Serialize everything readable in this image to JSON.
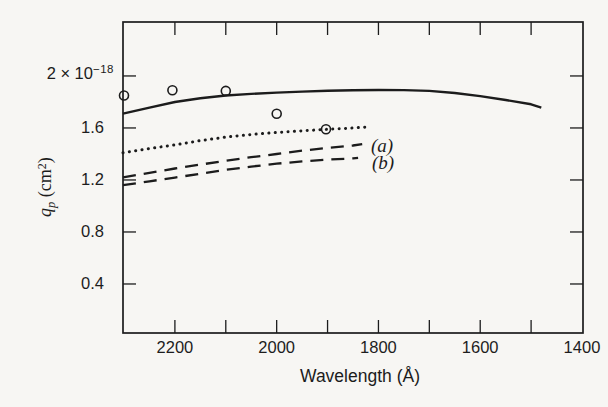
{
  "colors": {
    "ink": "#1c1c1c",
    "background": "#f7f6f3"
  },
  "chart_data": {
    "type": "line",
    "title": "",
    "xlabel": "Wavelength (Å)",
    "ylabel": "qₚ (cm²)",
    "ylabel_parts": {
      "symbol": "q",
      "subscript": "p",
      "unit_open": " (cm",
      "exponent": "2",
      "unit_close": ")"
    },
    "y_top_label": {
      "base": "2 × 10",
      "exponent": "−18"
    },
    "x_axis_reversed": true,
    "grid": false,
    "x_range": [
      2302,
      1398
    ],
    "y_range": [
      0.023,
      2.415
    ],
    "x_ticks": [
      2200,
      2100,
      2000,
      1900,
      1800,
      1700,
      1600,
      1500
    ],
    "x_tick_labels": [
      {
        "value": 2200,
        "label": "2200"
      },
      {
        "value": 2000,
        "label": "2000"
      },
      {
        "value": 1800,
        "label": "1800"
      },
      {
        "value": 1600,
        "label": "1600"
      },
      {
        "value": 1400,
        "label": "1400"
      }
    ],
    "y_ticks": [
      2.0,
      1.6,
      1.2,
      0.8,
      0.4
    ],
    "y_tick_labels": [
      {
        "value": 1.6,
        "label": "1.6"
      },
      {
        "value": 1.2,
        "label": "1.2"
      },
      {
        "value": 0.8,
        "label": "0.8"
      },
      {
        "value": 0.4,
        "label": "0.4"
      }
    ],
    "series": [
      {
        "name": "theory-solid",
        "style": "solid",
        "points": [
          [
            2302,
            1.71
          ],
          [
            2250,
            1.757
          ],
          [
            2200,
            1.8
          ],
          [
            2150,
            1.828
          ],
          [
            2100,
            1.85
          ],
          [
            2050,
            1.862
          ],
          [
            2000,
            1.872
          ],
          [
            1950,
            1.88
          ],
          [
            1900,
            1.886
          ],
          [
            1850,
            1.89
          ],
          [
            1800,
            1.892
          ],
          [
            1750,
            1.891
          ],
          [
            1700,
            1.885
          ],
          [
            1650,
            1.869
          ],
          [
            1600,
            1.845
          ],
          [
            1550,
            1.815
          ],
          [
            1500,
            1.782
          ],
          [
            1480,
            1.757
          ]
        ]
      },
      {
        "name": "theory-dotted",
        "style": "dotted",
        "points": [
          [
            2302,
            1.41
          ],
          [
            2250,
            1.442
          ],
          [
            2200,
            1.47
          ],
          [
            2150,
            1.503
          ],
          [
            2100,
            1.53
          ],
          [
            2050,
            1.55
          ],
          [
            2000,
            1.565
          ],
          [
            1950,
            1.578
          ],
          [
            1900,
            1.59
          ],
          [
            1850,
            1.6
          ],
          [
            1826,
            1.607
          ]
        ]
      },
      {
        "name": "curve-a",
        "style": "dashed",
        "label": "(a)",
        "points": [
          [
            2302,
            1.22
          ],
          [
            2250,
            1.255
          ],
          [
            2200,
            1.288
          ],
          [
            2150,
            1.318
          ],
          [
            2100,
            1.348
          ],
          [
            2050,
            1.375
          ],
          [
            2000,
            1.4
          ],
          [
            1950,
            1.425
          ],
          [
            1900,
            1.447
          ],
          [
            1850,
            1.465
          ],
          [
            1832,
            1.475
          ]
        ]
      },
      {
        "name": "curve-b",
        "style": "dashed",
        "label": "(b)",
        "points": [
          [
            2302,
            1.16
          ],
          [
            2250,
            1.19
          ],
          [
            2200,
            1.218
          ],
          [
            2150,
            1.248
          ],
          [
            2100,
            1.278
          ],
          [
            2050,
            1.303
          ],
          [
            2000,
            1.325
          ],
          [
            1950,
            1.343
          ],
          [
            1900,
            1.357
          ],
          [
            1850,
            1.366
          ],
          [
            1840,
            1.37
          ]
        ]
      }
    ],
    "scatter": {
      "name": "experimental-points",
      "marker": "open-circle",
      "points": [
        [
          2300,
          1.85
        ],
        [
          2205,
          1.89
        ],
        [
          2100,
          1.885
        ],
        [
          2000,
          1.71
        ],
        [
          1903,
          1.59
        ]
      ]
    },
    "annotations": [
      {
        "label": "(a)",
        "x": 1793,
        "y": 1.468
      },
      {
        "label": "(b)",
        "x": 1791,
        "y": 1.335
      }
    ]
  }
}
